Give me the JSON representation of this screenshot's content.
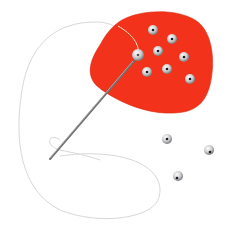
{
  "illustration": {
    "subject": "Needle and thread sewing beads onto red fabric",
    "colors": {
      "background": "#ffffff",
      "fabric": "#f2321a",
      "fabric_edge": "#d92a12",
      "thread": "#d8d8d8",
      "needle": "#8a8a8a",
      "bead_light": "#f4f4f4",
      "bead_dark": "#8f8f8f",
      "bead_hole": "#1a1a2e"
    },
    "beads_on_fabric": [
      {
        "cx": 153,
        "cy": 30
      },
      {
        "cx": 172,
        "cy": 39
      },
      {
        "cx": 158,
        "cy": 51
      },
      {
        "cx": 184,
        "cy": 57
      },
      {
        "cx": 147,
        "cy": 72
      },
      {
        "cx": 167,
        "cy": 69
      },
      {
        "cx": 190,
        "cy": 79
      }
    ],
    "threaded_bead": {
      "cx": 138,
      "cy": 55
    },
    "loose_beads": [
      {
        "cx": 167,
        "cy": 139
      },
      {
        "cx": 209,
        "cy": 150
      },
      {
        "cx": 178,
        "cy": 176
      }
    ]
  }
}
